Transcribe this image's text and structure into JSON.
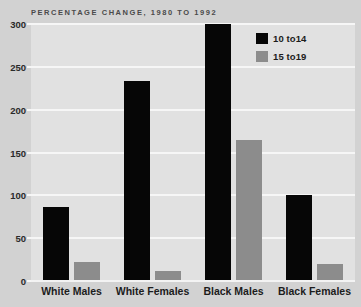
{
  "chart_data": {
    "type": "bar",
    "title": "PERCENTAGE CHANGE, 1980 TO 1992",
    "xlabel": "",
    "ylabel": "",
    "ylim": [
      0,
      300
    ],
    "yticks": [
      0,
      50,
      100,
      150,
      200,
      250,
      300
    ],
    "ytick_labels": [
      "0",
      "50",
      "100",
      "150",
      "200",
      "250",
      "300"
    ],
    "grid": true,
    "legend_position": "top-right",
    "categories": [
      "White Males",
      "White Females",
      "Black Males",
      "Black Females"
    ],
    "series": [
      {
        "name": "10 to14",
        "color": "#060606",
        "values": [
          86,
          233,
          300,
          100
        ]
      },
      {
        "name": "15 to19",
        "color": "#8c8c8c",
        "values": [
          22,
          12,
          165,
          20
        ]
      }
    ]
  },
  "legend": {
    "items": [
      {
        "label": "10 to14",
        "swatch": "series-a"
      },
      {
        "label": "15 to19",
        "swatch": "series-b"
      }
    ]
  },
  "colors": {
    "page_background": "#d2d2d2",
    "plot_background": "#e1e1e1",
    "gridline": "#f6f6f6",
    "series_a": "#060606",
    "series_b": "#8c8c8c",
    "title_text": "#4a4a4a",
    "axis_text": "#1c1c1c"
  }
}
